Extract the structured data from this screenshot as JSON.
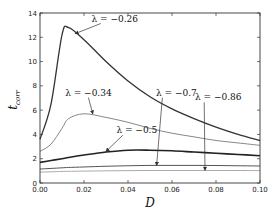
{
  "chart_data": {
    "type": "line",
    "title": "",
    "xlabel": "D",
    "ylabel": "t_corr",
    "xlim": [
      0.0,
      0.1
    ],
    "ylim": [
      0,
      14
    ],
    "grid": false,
    "x_ticks": [
      "0.00",
      "0.02",
      "0.04",
      "0.06",
      "0.08",
      "0.10"
    ],
    "y_ticks": [
      "0",
      "2",
      "4",
      "6",
      "8",
      "10",
      "12",
      "14"
    ],
    "x": [
      0.0,
      0.005,
      0.01,
      0.013,
      0.02,
      0.03,
      0.04,
      0.05,
      0.06,
      0.07,
      0.08,
      0.09,
      0.1
    ],
    "series": [
      {
        "name": "λ=−0.26",
        "color": "#333333",
        "width": 1.3,
        "values": [
          3.6,
          6.5,
          12.2,
          12.8,
          11.8,
          10.0,
          8.4,
          7.1,
          6.1,
          5.3,
          4.6,
          4.0,
          3.5
        ]
      },
      {
        "name": "λ=−0.34",
        "color": "#888888",
        "width": 1.0,
        "values": [
          2.6,
          3.2,
          4.5,
          5.3,
          5.7,
          5.4,
          5.0,
          4.5,
          4.1,
          3.8,
          3.5,
          3.3,
          3.1
        ]
      },
      {
        "name": "λ=−0.5",
        "color": "#222222",
        "width": 1.6,
        "values": [
          1.7,
          1.85,
          2.0,
          2.1,
          2.3,
          2.55,
          2.7,
          2.7,
          2.65,
          2.55,
          2.45,
          2.35,
          2.25
        ]
      },
      {
        "name": "λ=−0.7",
        "color": "#555555",
        "width": 1.0,
        "values": [
          1.15,
          1.2,
          1.25,
          1.28,
          1.32,
          1.38,
          1.42,
          1.45,
          1.45,
          1.45,
          1.44,
          1.42,
          1.4
        ]
      },
      {
        "name": "λ=−0.86",
        "color": "#aaaaaa",
        "width": 1.0,
        "values": [
          0.9,
          0.92,
          0.95,
          0.96,
          0.98,
          1.0,
          1.02,
          1.03,
          1.03,
          1.03,
          1.03,
          1.03,
          1.02
        ]
      }
    ],
    "annotations": [
      {
        "text": "λ = −0.26",
        "text_x": 0.034,
        "text_y": 13.3,
        "arrow_to_x": 0.016,
        "arrow_to_y": 12.3
      },
      {
        "text": "λ = −0.34",
        "text_x": 0.022,
        "text_y": 7.2,
        "arrow_to_x": 0.024,
        "arrow_to_y": 5.7
      },
      {
        "text": "λ = −0.5",
        "text_x": 0.044,
        "text_y": 4.1,
        "arrow_to_x": 0.03,
        "arrow_to_y": 2.6
      },
      {
        "text": "λ = −0.7",
        "text_x": 0.062,
        "text_y": 7.2,
        "arrow_to_x": 0.053,
        "arrow_to_y": 1.45
      },
      {
        "text": "λ = −0.86",
        "text_x": 0.081,
        "text_y": 6.8,
        "arrow_to_x": 0.075,
        "arrow_to_y": 1.05
      }
    ]
  }
}
